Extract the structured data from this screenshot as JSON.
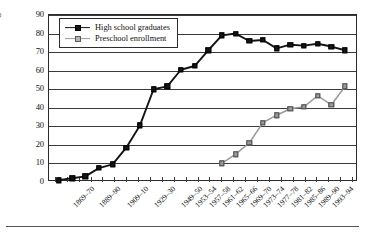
{
  "chart_data": {
    "type": "line",
    "title": "",
    "subtitle": "",
    "xlabel": "",
    "ylabel": "Percentage",
    "ylim": [
      0,
      90
    ],
    "ytick_step": 10,
    "yticks": [
      0,
      10,
      20,
      30,
      40,
      50,
      60,
      70,
      80,
      90
    ],
    "grid": true,
    "legend_position": "top-left",
    "categories": [
      "1869–70",
      "1889–90",
      "1909–10",
      "1929–30",
      "1949–50",
      "1953–54",
      "1957–58",
      "1961–62",
      "1965–66",
      "1969–70",
      "1973–74",
      "1977–78",
      "1981–82",
      "1985–86",
      "1989–90",
      "1993–94"
    ],
    "tick_labels_shown": [
      "1869–70",
      "1889–90",
      "1909–10",
      "1929–30",
      "1949–50",
      "1953–54",
      "1957–58",
      "1961–62",
      "1965–66",
      "1969–70",
      "1973–74",
      "1977–78",
      "1981–82",
      "1985–86",
      "1989–90",
      "1993–94"
    ],
    "x_positions": [
      0,
      1,
      2,
      3,
      4,
      5,
      6,
      7,
      8,
      9,
      10,
      11,
      12,
      13,
      14,
      15,
      16,
      17,
      18,
      19,
      20,
      21,
      22,
      23,
      24,
      25
    ],
    "series": [
      {
        "name": "High school graduates",
        "color": "#141414",
        "marker": "filled-square",
        "points": [
          {
            "x": 0.3,
            "y": 1
          },
          {
            "x": 1.45,
            "y": 2
          },
          {
            "x": 2.55,
            "y": 3
          },
          {
            "x": 3.7,
            "y": 7.5
          },
          {
            "x": 4.85,
            "y": 9.5
          },
          {
            "x": 6.0,
            "y": 18.5
          },
          {
            "x": 7.15,
            "y": 30.5
          },
          {
            "x": 8.3,
            "y": 50
          },
          {
            "x": 9.45,
            "y": 51.5
          },
          {
            "x": 10.6,
            "y": 60.5
          },
          {
            "x": 11.75,
            "y": 62.5
          },
          {
            "x": 12.9,
            "y": 71
          },
          {
            "x": 14.05,
            "y": 79
          },
          {
            "x": 15.2,
            "y": 80
          },
          {
            "x": 16.35,
            "y": 76
          },
          {
            "x": 17.5,
            "y": 76.5
          },
          {
            "x": 18.65,
            "y": 72
          },
          {
            "x": 19.8,
            "y": 74
          },
          {
            "x": 20.95,
            "y": 73.5
          },
          {
            "x": 22.1,
            "y": 74.5
          },
          {
            "x": 23.25,
            "y": 73
          },
          {
            "x": 24.4,
            "y": 71
          }
        ]
      },
      {
        "name": "Preschool enrollment",
        "color": "#9a9a9a",
        "marker": "open-square",
        "points": [
          {
            "x": 14.05,
            "y": 10
          },
          {
            "x": 15.2,
            "y": 15
          },
          {
            "x": 16.35,
            "y": 21
          },
          {
            "x": 17.5,
            "y": 32
          },
          {
            "x": 18.65,
            "y": 36
          },
          {
            "x": 19.8,
            "y": 39.5
          },
          {
            "x": 20.95,
            "y": 40.5
          },
          {
            "x": 22.1,
            "y": 46.5
          },
          {
            "x": 23.25,
            "y": 41.5
          },
          {
            "x": 24.4,
            "y": 51.5
          }
        ]
      }
    ]
  },
  "legend": {
    "items": [
      {
        "label": "High school graduates",
        "key": "hs"
      },
      {
        "label": "Preschool enrollment",
        "key": "ps"
      }
    ]
  },
  "axes": {
    "y_title": "Percentage"
  }
}
